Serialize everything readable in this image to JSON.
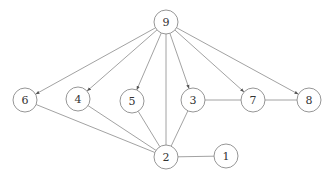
{
  "diagram": {
    "type": "graph",
    "node_radius": 12,
    "colors": {
      "stroke": "#8a8a8a",
      "label": "#333333",
      "fill": "#ffffff"
    },
    "nodes": [
      {
        "id": "9",
        "label": "9",
        "x": 166,
        "y": 22
      },
      {
        "id": "6",
        "label": "6",
        "x": 25,
        "y": 100
      },
      {
        "id": "4",
        "label": "4",
        "x": 78,
        "y": 99
      },
      {
        "id": "5",
        "label": "5",
        "x": 132,
        "y": 101
      },
      {
        "id": "3",
        "label": "3",
        "x": 193,
        "y": 100
      },
      {
        "id": "7",
        "label": "7",
        "x": 253,
        "y": 100
      },
      {
        "id": "8",
        "label": "8",
        "x": 309,
        "y": 100
      },
      {
        "id": "2",
        "label": "2",
        "x": 166,
        "y": 157
      },
      {
        "id": "1",
        "label": "1",
        "x": 226,
        "y": 156
      }
    ],
    "edges": [
      {
        "from": "9",
        "to": "6",
        "directed": true
      },
      {
        "from": "9",
        "to": "4",
        "directed": true
      },
      {
        "from": "9",
        "to": "5",
        "directed": true
      },
      {
        "from": "9",
        "to": "3",
        "directed": true
      },
      {
        "from": "9",
        "to": "7",
        "directed": true
      },
      {
        "from": "9",
        "to": "8",
        "directed": true
      },
      {
        "from": "9",
        "to": "2",
        "directed": false
      },
      {
        "from": "6",
        "to": "2",
        "directed": false
      },
      {
        "from": "4",
        "to": "2",
        "directed": false
      },
      {
        "from": "5",
        "to": "2",
        "directed": false
      },
      {
        "from": "3",
        "to": "2",
        "directed": false
      },
      {
        "from": "3",
        "to": "7",
        "directed": false
      },
      {
        "from": "7",
        "to": "8",
        "directed": false
      },
      {
        "from": "2",
        "to": "1",
        "directed": false
      }
    ]
  }
}
